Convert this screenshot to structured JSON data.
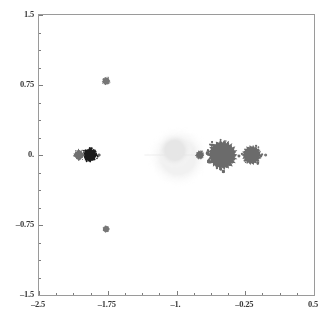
{
  "chart_data": {
    "type": "scatter",
    "title": "",
    "xlabel": "",
    "ylabel": "",
    "xlim": [
      -2.5,
      0.5
    ],
    "ylim": [
      -1.5,
      1.5
    ],
    "grid": false,
    "legend": null,
    "background_color": "#ffffff",
    "frame_color": "#9a9a9a",
    "xticks": [
      -2.5,
      -1.75,
      -1.0,
      -0.25,
      0.5
    ],
    "xtick_labels": [
      "-2.5",
      "-1.75",
      "-1.",
      "-0.25",
      "0.5"
    ],
    "yticks": [
      -1.5,
      -0.75,
      0.0,
      0.75,
      1.5
    ],
    "ytick_labels": [
      "-1.5",
      "-0.75",
      "0.",
      "0.75",
      "1.5"
    ],
    "x_minor_ticks": [
      -2.3125,
      -2.125,
      -1.9375,
      -1.5625,
      -1.375,
      -1.1875,
      -0.8125,
      -0.625,
      -0.4375,
      -0.0625,
      0.125,
      0.3125
    ],
    "y_minor_ticks": [
      -1.3125,
      -1.125,
      -0.9375,
      -0.5625,
      -0.375,
      -0.1875,
      0.1875,
      0.375,
      0.5625,
      0.9375,
      1.125,
      1.3125
    ],
    "point_color": "#6b6b6b",
    "dark_point_color": "#1c1c1c",
    "faint_point_color": "#ededed",
    "clusters": [
      {
        "name": "main-cardioid-blob",
        "cx": -0.5,
        "cy": 0.0,
        "r": 0.15,
        "color": "#6b6b6b",
        "opacity": 1.0,
        "spikes": 22
      },
      {
        "name": "period-2-disc",
        "cx": -0.18,
        "cy": 0.0,
        "r": 0.098,
        "color": "#6b6b6b",
        "opacity": 1.0,
        "spikes": 18
      },
      {
        "name": "left-satellite-small",
        "cx": -0.745,
        "cy": 0.0,
        "r": 0.043,
        "color": "#6b6b6b",
        "opacity": 1.0,
        "spikes": 10
      },
      {
        "name": "right-tip-speck",
        "cx": -0.028,
        "cy": 0.0,
        "r": 0.016,
        "color": "#6b6b6b",
        "opacity": 0.9,
        "spikes": 0
      },
      {
        "name": "far-left-dark-disc",
        "cx": -1.945,
        "cy": 0.0,
        "r": 0.072,
        "color": "#1c1c1c",
        "opacity": 1.0,
        "spikes": 8
      },
      {
        "name": "far-left-gray-disc",
        "cx": -2.065,
        "cy": 0.0,
        "r": 0.052,
        "color": "#707070",
        "opacity": 1.0,
        "spikes": 4
      },
      {
        "name": "far-left-tip-speck",
        "cx": -1.845,
        "cy": 0.0,
        "r": 0.017,
        "color": "#555555",
        "opacity": 0.9,
        "spikes": 0
      },
      {
        "name": "upper-satellite",
        "cx": -1.768,
        "cy": 0.793,
        "r": 0.04,
        "color": "#5e5e5e",
        "opacity": 0.85,
        "spikes": 7
      },
      {
        "name": "lower-satellite",
        "cx": -1.768,
        "cy": -0.793,
        "r": 0.038,
        "color": "#5e5e5e",
        "opacity": 0.85,
        "spikes": 7
      },
      {
        "name": "faint-central-cloud",
        "cx": -0.98,
        "cy": -0.02,
        "r": 0.34,
        "color": "#ececec",
        "opacity": 0.75,
        "spikes": 0
      },
      {
        "name": "faint-cloud-inner",
        "cx": -1.02,
        "cy": 0.05,
        "r": 0.195,
        "color": "#e2e2e2",
        "opacity": 0.7,
        "spikes": 0
      }
    ],
    "faint_specks": [
      {
        "x": -1.93,
        "y": 1.2,
        "r": 0.012,
        "color": "#f0f0f0"
      },
      {
        "x": -1.62,
        "y": 1.13,
        "r": 0.01,
        "color": "#f2f2f2"
      },
      {
        "x": -0.88,
        "y": 1.22,
        "r": 0.01,
        "color": "#efefef"
      },
      {
        "x": -0.63,
        "y": 1.08,
        "r": 0.013,
        "color": "#eaeaea"
      },
      {
        "x": -0.52,
        "y": 1.06,
        "r": 0.009,
        "color": "#f1f1f1"
      },
      {
        "x": -0.45,
        "y": 1.18,
        "r": 0.009,
        "color": "#f3f3f3"
      },
      {
        "x": -0.7,
        "y": 0.8,
        "r": 0.01,
        "color": "#f0f0f0"
      },
      {
        "x": -0.92,
        "y": 0.55,
        "r": 0.009,
        "color": "#f2f2f2"
      },
      {
        "x": -2.46,
        "y": 0.18,
        "r": 0.011,
        "color": "#e9e9e9"
      },
      {
        "x": -2.41,
        "y": -0.66,
        "r": 0.012,
        "color": "#ececec"
      },
      {
        "x": -1.64,
        "y": -0.44,
        "r": 0.01,
        "color": "#f1f1f1"
      },
      {
        "x": -1.62,
        "y": -1.13,
        "r": 0.011,
        "color": "#eeeeee"
      },
      {
        "x": -0.72,
        "y": -0.72,
        "r": 0.01,
        "color": "#f0f0f0"
      },
      {
        "x": -1.17,
        "y": -0.98,
        "r": 0.01,
        "color": "#f2f2f2"
      },
      {
        "x": -0.28,
        "y": -0.42,
        "r": 0.009,
        "color": "#f3f3f3"
      },
      {
        "x": -0.1,
        "y": -1.28,
        "r": 0.009,
        "color": "#f2f2f2"
      },
      {
        "x": -2.05,
        "y": -1.3,
        "r": 0.009,
        "color": "#f3f3f3"
      }
    ]
  }
}
